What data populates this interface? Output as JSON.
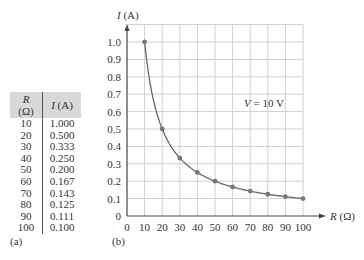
{
  "table": {
    "headers": [
      "R (Ω)",
      "I (A)"
    ],
    "rows": [
      [
        "10",
        "1.000"
      ],
      [
        "20",
        "0.500"
      ],
      [
        "30",
        "0.333"
      ],
      [
        "40",
        "0.250"
      ],
      [
        "50",
        "0.200"
      ],
      [
        "60",
        "0.167"
      ],
      [
        "70",
        "0.143"
      ],
      [
        "80",
        "0.125"
      ],
      [
        "90",
        "0.111"
      ],
      [
        "100",
        "0.100"
      ]
    ],
    "caption": "(a)"
  },
  "figure": {
    "caption": "(b)",
    "annotation": "V = 10 V"
  },
  "chart_data": {
    "type": "line",
    "title": "",
    "xlabel": "R (Ω)",
    "ylabel": "I (A)",
    "x": [
      10,
      20,
      30,
      40,
      50,
      60,
      70,
      80,
      90,
      100
    ],
    "series": [
      {
        "name": "I = V/R",
        "values": [
          1.0,
          0.5,
          0.333,
          0.25,
          0.2,
          0.167,
          0.143,
          0.125,
          0.111,
          0.1
        ]
      }
    ],
    "xlim": [
      0,
      100
    ],
    "ylim": [
      0,
      1.0
    ],
    "xticks": [
      "0",
      "10",
      "20",
      "30",
      "40",
      "50",
      "60",
      "70",
      "80",
      "90",
      "100"
    ],
    "yticks": [
      "0",
      "0.1",
      "0.2",
      "0.3",
      "0.4",
      "0.5",
      "0.6",
      "0.7",
      "0.8",
      "0.9",
      "1.0"
    ],
    "grid": true,
    "annotations": [
      "V = 10 V"
    ],
    "markers": true
  }
}
